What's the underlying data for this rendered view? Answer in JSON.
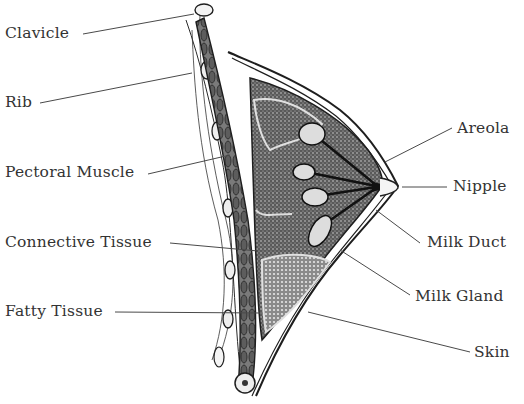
{
  "diagram": {
    "labels": {
      "clavicle": "Clavicle",
      "rib": "Rib",
      "pectoral_muscle": "Pectoral Muscle",
      "connective_tissue": "Connective Tissue",
      "fatty_tissue": "Fatty Tissue",
      "areola": "Areola",
      "nipple": "Nipple",
      "milk_duct": "Milk Duct",
      "milk_gland": "Milk Gland",
      "skin": "Skin"
    },
    "colors": {
      "ink": "#1e1e1e",
      "label_text": "#333333",
      "tissue_dark": "#3a3a3a",
      "tissue_light": "#9a9a9a",
      "background": "#ffffff"
    }
  }
}
